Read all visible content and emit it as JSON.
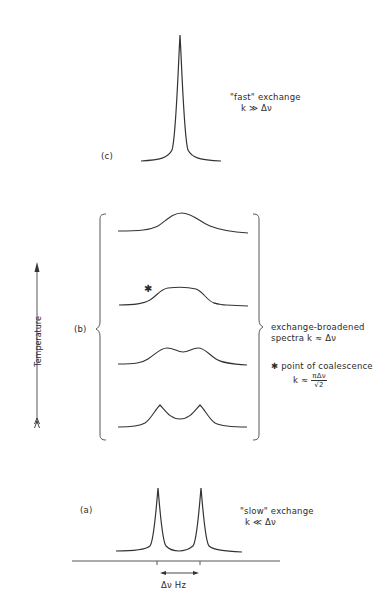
{
  "figure": {
    "panels": {
      "c": {
        "tag": "(c)",
        "title": "\"fast\" exchange",
        "condition": "k ≫ Δν"
      },
      "b": {
        "tag": "(b)",
        "title_line1": "exchange-broadened",
        "title_line2": "spectra k ≈ Δν",
        "coalescence_label": "✱ point of coalescence",
        "coalescence_formula_prefix": "k ≈",
        "coalescence_formula_num": "πΔν",
        "coalescence_formula_den": "√2",
        "asterisk": "✱"
      },
      "a": {
        "tag": "(a)",
        "title": "\"slow\" exchange",
        "condition": "k ≪ Δν",
        "axis_label": "Δν  Hz"
      }
    },
    "temperature_axis": {
      "label": "Temperature",
      "direction": "up"
    },
    "line_color": "#333333"
  }
}
